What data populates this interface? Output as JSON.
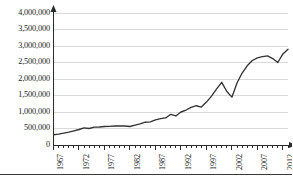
{
  "chart_data": {
    "type": "line",
    "title": "",
    "subtitle": "",
    "xlabel": "",
    "ylabel": "",
    "grid": true,
    "legend": false,
    "legend_position": "none",
    "line_color": "#333333",
    "gridline_color": "#d9d9d9",
    "axis_color": "#2b2b2b",
    "xlim": [
      1967,
      2013
    ],
    "ylim": [
      0,
      4000000
    ],
    "ytick_values": [
      0,
      500000,
      1000000,
      1500000,
      2000000,
      2500000,
      3000000,
      3500000,
      4000000
    ],
    "ytick_labels": [
      "0",
      "500,000",
      "1,000,000",
      "1,500,000",
      "2,000,000",
      "2,500,000",
      "3,000,000",
      "3,500,000",
      "4,000,000"
    ],
    "xtick_labels": [
      "1967",
      "1972",
      "1977",
      "1982",
      "1987",
      "1992",
      "1997",
      "2002",
      "2007",
      "2012"
    ],
    "xtick_values": [
      1967,
      1972,
      1977,
      1982,
      1987,
      1992,
      1997,
      2002,
      2007,
      2012
    ],
    "xtick_minor_step": 1,
    "x": [
      1967,
      1968,
      1969,
      1970,
      1971,
      1972,
      1973,
      1974,
      1975,
      1976,
      1977,
      1978,
      1979,
      1980,
      1981,
      1982,
      1983,
      1984,
      1985,
      1986,
      1987,
      1988,
      1989,
      1990,
      1991,
      1992,
      1993,
      1994,
      1995,
      1996,
      1997,
      1998,
      1999,
      2000,
      2001,
      2002,
      2003,
      2004,
      2005,
      2006,
      2007,
      2008,
      2009,
      2010,
      2011,
      2012,
      2013
    ],
    "values": [
      310000,
      330000,
      360000,
      390000,
      430000,
      470000,
      520000,
      500000,
      540000,
      545000,
      560000,
      565000,
      575000,
      580000,
      575000,
      560000,
      600000,
      640000,
      690000,
      700000,
      760000,
      800000,
      820000,
      930000,
      880000,
      1000000,
      1060000,
      1140000,
      1190000,
      1150000,
      1300000,
      1480000,
      1700000,
      1900000,
      1620000,
      1450000,
      1880000,
      2180000,
      2400000,
      2560000,
      2640000,
      2680000,
      2700000,
      2620000,
      2500000,
      2760000,
      2900000
    ],
    "series": [
      {
        "name": "series-1",
        "values": [
          310000,
          330000,
          360000,
          390000,
          430000,
          470000,
          520000,
          500000,
          540000,
          545000,
          560000,
          565000,
          575000,
          580000,
          575000,
          560000,
          600000,
          640000,
          690000,
          700000,
          760000,
          800000,
          820000,
          930000,
          880000,
          1000000,
          1060000,
          1140000,
          1190000,
          1150000,
          1300000,
          1480000,
          1700000,
          1900000,
          1620000,
          1450000,
          1880000,
          2180000,
          2400000,
          2560000,
          2640000,
          2680000,
          2700000,
          2620000,
          2500000,
          2760000,
          2900000
        ]
      }
    ]
  }
}
